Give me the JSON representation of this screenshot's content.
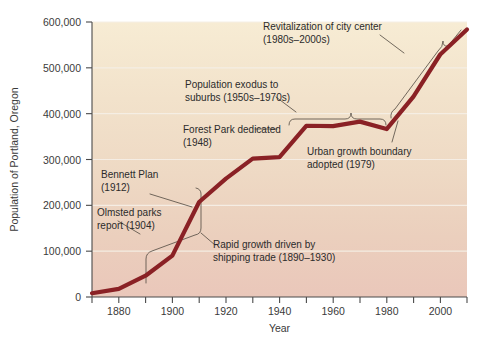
{
  "chart_data": {
    "type": "line",
    "title": "",
    "xlabel": "Year",
    "ylabel": "Population of Portland, Oregon",
    "xlim": [
      1870,
      2010
    ],
    "ylim": [
      0,
      600000
    ],
    "grid": true,
    "legend": "none",
    "x_ticks": [
      "1880",
      "1900",
      "1920",
      "1940",
      "1960",
      "1980",
      "2000"
    ],
    "x_tick_values": [
      1880,
      1900,
      1920,
      1940,
      1960,
      1980,
      2000
    ],
    "x_minor_step": 10,
    "y_ticks": [
      "0",
      "100,000",
      "200,000",
      "300,000",
      "400,000",
      "500,000",
      "600,000"
    ],
    "y_tick_values": [
      0,
      100000,
      200000,
      300000,
      400000,
      500000,
      600000
    ],
    "series": [
      {
        "name": "Population of Portland, Oregon",
        "color": "#8a2125",
        "x": [
          1870,
          1880,
          1890,
          1900,
          1910,
          1920,
          1930,
          1940,
          1950,
          1960,
          1970,
          1980,
          1990,
          2000,
          2010
        ],
        "values": [
          8300,
          17600,
          46400,
          90400,
          207200,
          258300,
          301800,
          305400,
          373600,
          372700,
          382600,
          366400,
          437300,
          529100,
          583800
        ]
      }
    ],
    "annotations": [
      {
        "id": "olmsted",
        "label": "Olmsted parks\nreport (1904)",
        "lines": [
          "Olmsted parks",
          "report (1904)"
        ],
        "x": 1904,
        "y": 120000
      },
      {
        "id": "bennett",
        "label": "Bennett Plan\n(1912)",
        "lines": [
          "Bennett Plan",
          "(1912)"
        ],
        "x": 1912,
        "y": 215000
      },
      {
        "id": "rapid-growth",
        "label": "Rapid growth driven by\nshipping trade (1890–1930)",
        "lines": [
          "Rapid growth driven by",
          "shipping trade (1890–1930)"
        ],
        "x_range": [
          1890,
          1930
        ]
      },
      {
        "id": "forest-park",
        "label": "Forest Park dedicated\n(1948)",
        "lines": [
          "Forest Park dedicated",
          "(1948)"
        ],
        "x": 1948,
        "y": 373600
      },
      {
        "id": "exodus",
        "label": "Population exodus to\nsuburbs (1950s–1970s)",
        "lines": [
          "Population exodus to",
          "suburbs (1950s–1970s)"
        ],
        "x_range": [
          1950,
          1980
        ]
      },
      {
        "id": "urban-growth-boundary",
        "label": "Urban growth boundary\nadopted (1979)",
        "lines": [
          "Urban growth boundary",
          "adopted (1979)"
        ],
        "x": 1979,
        "y": 368000
      },
      {
        "id": "revitalization",
        "label": "Revitalization of city center\n(1980s–2000s)",
        "lines": [
          "Revitalization of city center",
          "(1980s–2000s)"
        ],
        "x_range": [
          1980,
          2009
        ]
      }
    ],
    "colors": {
      "line": "#8a2125",
      "plot_bg_top": "#f6ead1",
      "plot_bg_bottom": "#ebc8bb",
      "gridline": "#f4ece1",
      "axis": "#4a4a4a",
      "text": "#2b2b2b",
      "leader": "#5a5248"
    }
  }
}
